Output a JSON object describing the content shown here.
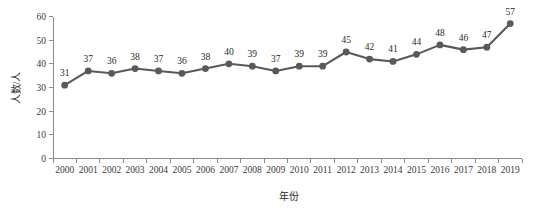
{
  "chart_data": {
    "type": "line",
    "title": "",
    "subtitle": "",
    "xlabel": "年份",
    "ylabel": "人数/人",
    "categories": [
      "2000",
      "2001",
      "2002",
      "2003",
      "2004",
      "2005",
      "2006",
      "2007",
      "2008",
      "2009",
      "2010",
      "2011",
      "2012",
      "2013",
      "2014",
      "2015",
      "2016",
      "2017",
      "2018",
      "2019"
    ],
    "values": [
      31,
      37,
      36,
      38,
      37,
      36,
      38,
      40,
      39,
      37,
      39,
      39,
      45,
      42,
      41,
      44,
      48,
      46,
      47,
      57
    ],
    "point_labels": [
      "31",
      "37",
      "36",
      "38",
      "37",
      "36",
      "38",
      "40",
      "39",
      "37",
      "39",
      "39",
      "45",
      "42",
      "41",
      "44",
      "48",
      "46",
      "47",
      "57"
    ],
    "ylim": [
      0,
      60
    ],
    "y_ticks": [
      "0",
      "10",
      "20",
      "30",
      "40",
      "50",
      "60"
    ],
    "y_tick_values": [
      0,
      10,
      20,
      30,
      40,
      50,
      60
    ],
    "grid": false,
    "legend": false,
    "legend_position": "none",
    "series": [
      {
        "name": "人数",
        "color": "#595959",
        "marker": "circle",
        "values": [
          31,
          37,
          36,
          38,
          37,
          36,
          38,
          40,
          39,
          37,
          39,
          39,
          45,
          42,
          41,
          44,
          48,
          46,
          47,
          57
        ]
      }
    ],
    "colors": {
      "line": "#595959",
      "marker": "#595959",
      "axis": "#8a8a8a",
      "text": "#2b2b2b",
      "background": "#ffffff"
    }
  }
}
